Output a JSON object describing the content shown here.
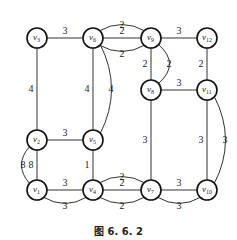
{
  "figure": {
    "caption": "图 6. 6. 2",
    "nodes": [
      {
        "id": "v1",
        "label": "v",
        "sub": "1",
        "x": 37,
        "y": 190
      },
      {
        "id": "v2",
        "label": "v",
        "sub": "2",
        "x": 37,
        "y": 140
      },
      {
        "id": "v3",
        "label": "v",
        "sub": "3",
        "x": 37,
        "y": 38
      },
      {
        "id": "v4",
        "label": "v",
        "sub": "4",
        "x": 93,
        "y": 190
      },
      {
        "id": "v5",
        "label": "v",
        "sub": "5",
        "x": 93,
        "y": 140
      },
      {
        "id": "v6",
        "label": "v",
        "sub": "6",
        "x": 93,
        "y": 38
      },
      {
        "id": "v7",
        "label": "v",
        "sub": "7",
        "x": 151,
        "y": 190
      },
      {
        "id": "v8",
        "label": "v",
        "sub": "8",
        "x": 151,
        "y": 90
      },
      {
        "id": "v9",
        "label": "v",
        "sub": "9",
        "x": 151,
        "y": 38
      },
      {
        "id": "v10",
        "label": "v",
        "sub": "10",
        "x": 207,
        "y": 190
      },
      {
        "id": "v11",
        "label": "v",
        "sub": "11",
        "x": 207,
        "y": 90
      },
      {
        "id": "v12",
        "label": "v",
        "sub": "12",
        "x": 207,
        "y": 38
      }
    ],
    "edges": [
      {
        "from": "v3",
        "to": "v6",
        "weight": "3",
        "shape": "straight"
      },
      {
        "from": "v6",
        "to": "v9",
        "weight": "2",
        "shape": "curve-above"
      },
      {
        "from": "v6",
        "to": "v9",
        "weight": "2",
        "shape": "straight"
      },
      {
        "from": "v6",
        "to": "v9",
        "weight": "2",
        "shape": "curve-below"
      },
      {
        "from": "v9",
        "to": "v12",
        "weight": "3",
        "shape": "straight"
      },
      {
        "from": "v3",
        "to": "v2",
        "weight": "4",
        "shape": "straight"
      },
      {
        "from": "v6",
        "to": "v5",
        "weight": "4",
        "shape": "straight"
      },
      {
        "from": "v6",
        "to": "v5",
        "weight": "4",
        "shape": "curve-right"
      },
      {
        "from": "v9",
        "to": "v8",
        "weight": "2",
        "shape": "straight"
      },
      {
        "from": "v9",
        "to": "v8",
        "weight": "2",
        "shape": "curve-right"
      },
      {
        "from": "v12",
        "to": "v11",
        "weight": "2",
        "shape": "straight"
      },
      {
        "from": "v8",
        "to": "v11",
        "weight": "3",
        "shape": "straight"
      },
      {
        "from": "v2",
        "to": "v5",
        "weight": "3",
        "shape": "straight"
      },
      {
        "from": "v2",
        "to": "v1",
        "weight": "8",
        "shape": "straight"
      },
      {
        "from": "v2",
        "to": "v1",
        "weight": "8",
        "shape": "curve-left"
      },
      {
        "from": "v5",
        "to": "v4",
        "weight": "1",
        "shape": "straight"
      },
      {
        "from": "v1",
        "to": "v4",
        "weight": "3",
        "shape": "straight"
      },
      {
        "from": "v1",
        "to": "v4",
        "weight": "3",
        "shape": "curve-below"
      },
      {
        "from": "v4",
        "to": "v7",
        "weight": "2",
        "shape": "curve-above"
      },
      {
        "from": "v4",
        "to": "v7",
        "weight": "2",
        "shape": "straight"
      },
      {
        "from": "v4",
        "to": "v7",
        "weight": "2",
        "shape": "curve-below"
      },
      {
        "from": "v7",
        "to": "v10",
        "weight": "3",
        "shape": "straight"
      },
      {
        "from": "v7",
        "to": "v10",
        "weight": "3",
        "shape": "curve-below"
      },
      {
        "from": "v8",
        "to": "v7",
        "weight": "3",
        "shape": "straight"
      },
      {
        "from": "v11",
        "to": "v10",
        "weight": "3",
        "shape": "straight"
      },
      {
        "from": "v11",
        "to": "v10",
        "weight": "3",
        "shape": "curve-right"
      }
    ]
  }
}
